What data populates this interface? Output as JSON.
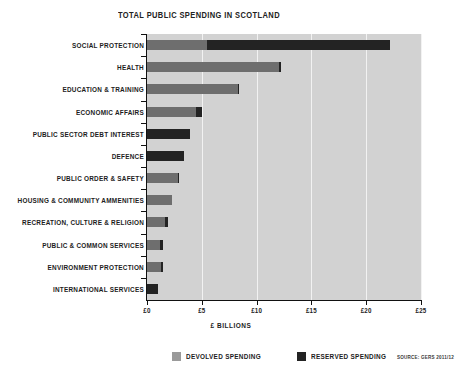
{
  "chart_data": {
    "type": "bar",
    "orientation": "horizontal",
    "stacked": true,
    "title": "TOTAL PUBLIC SPENDING IN SCOTLAND",
    "xlabel": "£ BILLIONS",
    "ylabel": "",
    "xlim": [
      0,
      25
    ],
    "grid": true,
    "legend_position": "bottom",
    "source": "SOURCE: GERS 2011/12",
    "xticks": [
      0,
      5,
      10,
      15,
      20,
      25
    ],
    "xtick_labels": [
      "£0",
      "£5",
      "£10",
      "£15",
      "£20",
      "£25"
    ],
    "categories": [
      "SOCIAL PROTECTION",
      "HEALTH",
      "EDUCATION & TRAINING",
      "ECONOMIC AFFAIRS",
      "PUBLIC SECTOR DEBT INTEREST",
      "DEFENCE",
      "PUBLIC ORDER & SAFETY",
      "HOUSING & COMMUNITY AMMENITIES",
      "RECREATION, CULTURE & RELIGION",
      "PUBLIC & COMMON SERVICES",
      "ENVIRONMENT PROTECTION",
      "INTERNATIONAL SERVICES"
    ],
    "series": [
      {
        "name": "DEVOLVED SPENDING",
        "color": "#6e6e6e",
        "values": [
          5.5,
          12.0,
          8.3,
          4.5,
          0.0,
          0.0,
          2.8,
          2.3,
          1.6,
          1.2,
          1.3,
          0.0
        ]
      },
      {
        "name": "RESERVED SPENDING",
        "color": "#232323",
        "values": [
          16.7,
          0.2,
          0.1,
          0.5,
          3.9,
          3.4,
          0.1,
          0.0,
          0.3,
          0.3,
          0.2,
          1.0
        ]
      }
    ],
    "totals": [
      22.2,
      12.2,
      8.4,
      5.0,
      3.9,
      3.4,
      2.9,
      2.3,
      1.9,
      1.5,
      1.5,
      1.0
    ]
  },
  "legend": [
    {
      "label": "DEVOLVED SPENDING",
      "swatch": "devolved"
    },
    {
      "label": "RESERVED SPENDING",
      "swatch": "reserved"
    }
  ]
}
